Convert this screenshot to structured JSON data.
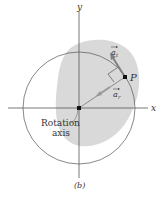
{
  "figure": {
    "axes": {
      "x_label": "x",
      "y_label": "y"
    },
    "point_label": "P",
    "vectors": {
      "tangential": {
        "symbol": "a",
        "subscript": "t"
      },
      "radial": {
        "symbol": "a",
        "subscript": "r"
      }
    },
    "rotation_axis_label_line1": "Rotation",
    "rotation_axis_label_line2": "axis",
    "caption": "(b)",
    "colors": {
      "body": "#d9d9d9",
      "lines": "#555555",
      "vector": "#8a8a8a"
    }
  }
}
